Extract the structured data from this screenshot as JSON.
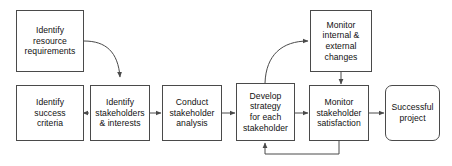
{
  "diagram": {
    "type": "flowchart",
    "background_color": "#ffffff",
    "stroke_color": "#4a4a4a",
    "text_color": "#111111",
    "nodes": [
      {
        "id": "identify-resource-requirements",
        "label": "Identify\nresource\nrequirements",
        "shape": "rectangle",
        "x": 16,
        "y": 10,
        "width": 68,
        "height": 62
      },
      {
        "id": "monitor-internal-external-changes",
        "label": "Monitor\ninternal &\nexternal\nchanges",
        "shape": "rectangle",
        "x": 310,
        "y": 10,
        "width": 62,
        "height": 62
      },
      {
        "id": "identify-success-criteria",
        "label": "Identify\nsuccess\ncriteria",
        "shape": "rectangle",
        "x": 16,
        "y": 85,
        "width": 68,
        "height": 56
      },
      {
        "id": "identify-stakeholders-interests",
        "label": "Identify\nstakeholders\n& interests",
        "shape": "rectangle",
        "x": 90,
        "y": 85,
        "width": 60,
        "height": 56
      },
      {
        "id": "conduct-stakeholder-analysis",
        "label": "Conduct\nstakeholder\nanalysis",
        "shape": "rectangle",
        "x": 162,
        "y": 85,
        "width": 60,
        "height": 56
      },
      {
        "id": "develop-strategy-for-each-stakeholder",
        "label": "Develop\nstrategy\nfor each\nstakeholder",
        "shape": "rectangle",
        "x": 236,
        "y": 83,
        "width": 59,
        "height": 58
      },
      {
        "id": "monitor-stakeholder-satisfaction",
        "label": "Monitor\nstakeholder\nsatisfaction",
        "shape": "rectangle",
        "x": 309,
        "y": 85,
        "width": 60,
        "height": 56
      },
      {
        "id": "successful-project",
        "label": "Successful\nproject",
        "shape": "rounded-rectangle",
        "x": 385,
        "y": 85,
        "width": 55,
        "height": 56
      }
    ],
    "edges": [
      {
        "id": "resource-to-stakeholders",
        "from": "identify-resource-requirements",
        "to": "identify-stakeholders-interests",
        "style": "curved",
        "arrow": "end"
      },
      {
        "id": "success-to-stakeholders",
        "from": "identify-success-criteria",
        "to": "identify-stakeholders-interests",
        "style": "straight",
        "arrow": "end"
      },
      {
        "id": "stakeholders-to-analysis",
        "from": "identify-stakeholders-interests",
        "to": "conduct-stakeholder-analysis",
        "style": "straight",
        "arrow": "end"
      },
      {
        "id": "analysis-to-strategy",
        "from": "conduct-stakeholder-analysis",
        "to": "develop-strategy-for-each-stakeholder",
        "style": "straight",
        "arrow": "end"
      },
      {
        "id": "strategy-to-monitor-changes",
        "from": "develop-strategy-for-each-stakeholder",
        "to": "monitor-internal-external-changes",
        "style": "curved",
        "arrow": "end"
      },
      {
        "id": "strategy-to-satisfaction",
        "from": "develop-strategy-for-each-stakeholder",
        "to": "monitor-stakeholder-satisfaction",
        "style": "straight",
        "arrow": "end"
      },
      {
        "id": "monitor-changes-to-satisfaction",
        "from": "monitor-internal-external-changes",
        "to": "monitor-stakeholder-satisfaction",
        "style": "straight",
        "arrow": "end"
      },
      {
        "id": "satisfaction-to-successful-project",
        "from": "monitor-stakeholder-satisfaction",
        "to": "successful-project",
        "style": "straight",
        "arrow": "end"
      },
      {
        "id": "satisfaction-feedback-to-strategy",
        "from": "monitor-stakeholder-satisfaction",
        "to": "develop-strategy-for-each-stakeholder",
        "style": "orthogonal-feedback",
        "arrow": "end"
      }
    ]
  }
}
